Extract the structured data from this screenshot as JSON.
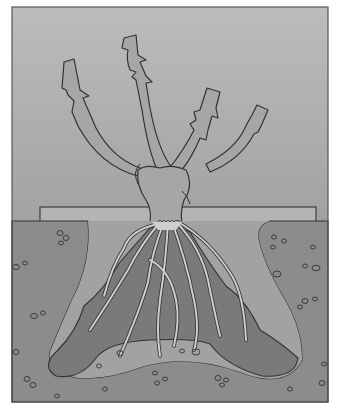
{
  "figure": {
    "title": "Planting a bare-root rose",
    "parts": [
      "canes",
      "bud union / crown",
      "board marking soil level",
      "roots",
      "soil mound",
      "planting hole",
      "surrounding soil with pebbles"
    ]
  },
  "colors": {
    "background": "#ffffff",
    "sky_top": "#b9b9b9",
    "sky_bottom": "#a4a4a4",
    "plant": "#a6a6a6",
    "board": "#b4b4b4",
    "soil": "#8c8c8c",
    "hole": "#a2a2a2",
    "mound": "#7a7a7a",
    "roots": "#cfcfcf",
    "outline": "#333333",
    "frame": "#555555"
  }
}
